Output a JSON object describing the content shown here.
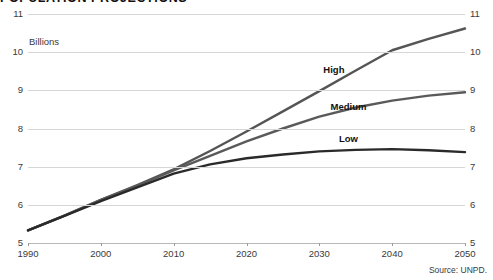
{
  "chart_data": {
    "type": "line",
    "title": "POPULATION PROJECTIONS",
    "subtitle": "",
    "xlabel": "",
    "ylabel": "Billions",
    "unit_label": "Billions",
    "source": "Source: UNPD.",
    "grid": true,
    "legend_position": "inline-labels",
    "xlim": [
      1990,
      2050
    ],
    "ylim": [
      5,
      11
    ],
    "ytick_labels_left": [
      "11",
      "10",
      "9",
      "8",
      "7",
      "6",
      "5"
    ],
    "ytick_labels_right": [
      "11",
      "10",
      "9",
      "8",
      "7",
      "6",
      "5"
    ],
    "yticks": [
      11,
      10,
      9,
      8,
      7,
      6,
      5
    ],
    "xticks": [
      1990,
      2000,
      2010,
      2020,
      2030,
      2040,
      2050
    ],
    "xtick_labels": [
      "1990",
      "2000",
      "2010",
      "2020",
      "2030",
      "2040",
      "2050"
    ],
    "x": [
      1990,
      1995,
      2000,
      2005,
      2010,
      2015,
      2020,
      2025,
      2030,
      2035,
      2040,
      2045,
      2050
    ],
    "series": [
      {
        "name": "High",
        "label": "High",
        "color": "#555555",
        "label_x": 2032,
        "label_y": 9.55,
        "values": [
          5.33,
          5.72,
          6.13,
          6.52,
          6.93,
          7.41,
          7.92,
          8.45,
          8.98,
          9.52,
          10.05,
          10.35,
          10.62
        ]
      },
      {
        "name": "Medium",
        "label": "Medium",
        "color": "#5a5a5a",
        "label_x": 2034,
        "label_y": 8.6,
        "values": [
          5.33,
          5.72,
          6.13,
          6.5,
          6.9,
          7.28,
          7.66,
          8.0,
          8.31,
          8.55,
          8.73,
          8.86,
          8.95
        ]
      },
      {
        "name": "Low",
        "label": "Low",
        "color": "#2a2a2a",
        "label_x": 2034,
        "label_y": 7.75,
        "values": [
          5.33,
          5.71,
          6.1,
          6.46,
          6.82,
          7.06,
          7.22,
          7.32,
          7.4,
          7.44,
          7.46,
          7.43,
          7.38
        ]
      }
    ]
  }
}
